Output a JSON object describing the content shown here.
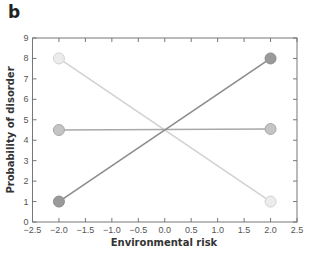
{
  "panel_label": "b",
  "chart_data": {
    "type": "line",
    "title": "",
    "xlabel": "Environmental risk",
    "ylabel": "Probability of disorder",
    "xlim": [
      -2.5,
      2.5
    ],
    "ylim": [
      0,
      9
    ],
    "x_ticks": [
      "-2.5",
      "-2.0",
      "-1.5",
      "-1.0",
      "-0.5",
      "0.0",
      "0.5",
      "1.0",
      "1.5",
      "2.0",
      "2.5"
    ],
    "y_ticks": [
      "0",
      "1",
      "2",
      "3",
      "4",
      "5",
      "6",
      "7",
      "8",
      "9"
    ],
    "grid": false,
    "legend": "none",
    "x": [
      -2.0,
      2.0
    ],
    "series": [
      {
        "name": "dark",
        "values": [
          1.0,
          8.0
        ],
        "color": "#8c8c8c",
        "fill": "#9a9a9a"
      },
      {
        "name": "medium",
        "values": [
          4.5,
          4.55
        ],
        "color": "#a8a8a8",
        "fill": "#c4c4c4"
      },
      {
        "name": "light",
        "values": [
          8.0,
          1.0
        ],
        "color": "#d2d2d2",
        "fill": "#ececec"
      }
    ]
  }
}
